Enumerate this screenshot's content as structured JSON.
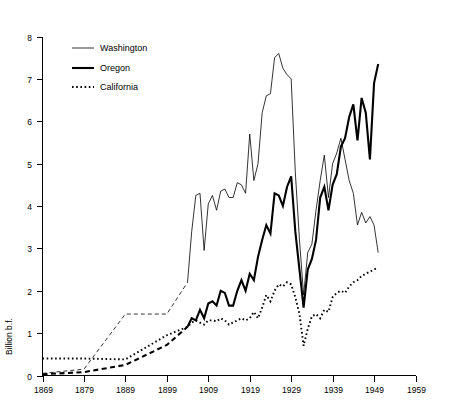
{
  "chart_data": {
    "type": "line",
    "title": "",
    "xlabel": "",
    "ylabel": "Billion b.f.",
    "xlim": [
      1869,
      1959
    ],
    "ylim": [
      0,
      8
    ],
    "grid": false,
    "legend_position": "top-left",
    "xticks": [
      1869,
      1879,
      1889,
      1899,
      1909,
      1919,
      1929,
      1939,
      1949,
      1959
    ],
    "yticks": [
      0,
      1,
      2,
      3,
      4,
      5,
      6,
      7,
      8
    ],
    "xtick_labels": [
      "1869",
      "1879",
      "1889",
      "1899",
      "1909",
      "1919",
      "1929",
      "1939",
      "1949",
      "1959"
    ],
    "ytick_labels": [
      "0",
      "1",
      "2",
      "3",
      "4",
      "5",
      "6",
      "7",
      "8"
    ],
    "series": [
      {
        "name": "Washington",
        "style": "thin-solid",
        "color": "#000000",
        "x": [
          1869,
          1879,
          1889,
          1899,
          1904,
          1905,
          1906,
          1907,
          1908,
          1909,
          1910,
          1911,
          1912,
          1913,
          1914,
          1915,
          1916,
          1917,
          1918,
          1919,
          1920,
          1921,
          1922,
          1923,
          1924,
          1925,
          1926,
          1927,
          1928,
          1929,
          1930,
          1931,
          1932,
          1933,
          1934,
          1935,
          1936,
          1937,
          1938,
          1939,
          1940,
          1941,
          1942,
          1943,
          1944,
          1945,
          1946,
          1947,
          1948,
          1949,
          1950
        ],
        "y": [
          0.05,
          0.15,
          1.45,
          1.45,
          2.2,
          3.4,
          4.25,
          4.3,
          2.95,
          4.05,
          4.25,
          3.9,
          4.35,
          4.4,
          4.2,
          4.2,
          4.55,
          4.5,
          4.3,
          5.7,
          4.6,
          5.0,
          6.2,
          6.6,
          6.65,
          7.5,
          7.6,
          7.25,
          7.1,
          7.0,
          4.8,
          3.2,
          1.9,
          2.9,
          3.1,
          3.9,
          4.6,
          5.2,
          4.2,
          5.0,
          5.25,
          5.6,
          5.1,
          4.6,
          4.3,
          3.55,
          3.85,
          3.6,
          3.75,
          3.55,
          2.9
        ]
      },
      {
        "name": "Oregon",
        "style": "thick-solid",
        "color": "#000000",
        "x": [
          1869,
          1879,
          1889,
          1899,
          1904,
          1905,
          1906,
          1907,
          1908,
          1909,
          1910,
          1911,
          1912,
          1913,
          1914,
          1915,
          1916,
          1917,
          1918,
          1919,
          1920,
          1921,
          1922,
          1923,
          1924,
          1925,
          1926,
          1927,
          1928,
          1929,
          1930,
          1931,
          1932,
          1933,
          1934,
          1935,
          1936,
          1937,
          1938,
          1939,
          1940,
          1941,
          1942,
          1943,
          1944,
          1945,
          1946,
          1947,
          1948,
          1949,
          1950
        ],
        "y": [
          0.03,
          0.08,
          0.25,
          0.72,
          1.15,
          1.35,
          1.3,
          1.55,
          1.35,
          1.7,
          1.75,
          1.65,
          2.0,
          1.95,
          1.65,
          1.65,
          2.0,
          2.25,
          2.0,
          2.4,
          2.25,
          2.8,
          3.2,
          3.55,
          3.35,
          4.3,
          4.25,
          4.0,
          4.45,
          4.7,
          3.4,
          2.5,
          1.6,
          2.5,
          2.75,
          3.2,
          4.2,
          4.45,
          3.9,
          4.5,
          4.75,
          5.4,
          5.6,
          6.1,
          6.4,
          5.55,
          6.55,
          6.2,
          5.1,
          6.9,
          7.35
        ]
      },
      {
        "name": "California",
        "style": "dotted",
        "color": "#000000",
        "x": [
          1869,
          1879,
          1889,
          1899,
          1904,
          1905,
          1906,
          1907,
          1908,
          1909,
          1910,
          1911,
          1912,
          1913,
          1914,
          1915,
          1916,
          1917,
          1918,
          1919,
          1920,
          1921,
          1922,
          1923,
          1924,
          1925,
          1926,
          1927,
          1928,
          1929,
          1930,
          1931,
          1932,
          1933,
          1934,
          1935,
          1936,
          1937,
          1938,
          1939,
          1940,
          1941,
          1942,
          1943,
          1944,
          1945,
          1946,
          1947,
          1948,
          1949,
          1950
        ],
        "y": [
          0.4,
          0.4,
          0.38,
          0.95,
          1.15,
          1.25,
          1.3,
          1.25,
          1.2,
          1.3,
          1.3,
          1.28,
          1.35,
          1.3,
          1.2,
          1.25,
          1.3,
          1.35,
          1.3,
          1.35,
          1.5,
          1.35,
          1.6,
          1.9,
          1.75,
          2.0,
          2.15,
          2.1,
          2.2,
          2.15,
          1.85,
          1.45,
          0.7,
          1.1,
          1.4,
          1.45,
          1.35,
          1.55,
          1.5,
          1.85,
          1.95,
          2.0,
          1.95,
          2.1,
          2.2,
          2.25,
          2.35,
          2.4,
          2.45,
          2.5,
          2.55
        ]
      }
    ]
  },
  "legend": {
    "entries": [
      {
        "label": "Washington",
        "style": "thin-solid"
      },
      {
        "label": "Oregon",
        "style": "thick-solid"
      },
      {
        "label": "California",
        "style": "dotted"
      }
    ]
  }
}
